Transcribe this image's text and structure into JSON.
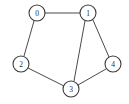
{
  "figure": {
    "background_color": "#ffffff",
    "width": 129,
    "height": 104
  },
  "style": {
    "edge_color": "#4a4a4a",
    "edge_width": 1,
    "node_fill": "#ffffff",
    "node_stroke": "#3a3a3a",
    "node_stroke_width": 1.1,
    "node_radius": 8,
    "label_color": "#2b2b2b",
    "label_font_size": 7.5
  },
  "graph": {
    "directed": false,
    "node_count": 5,
    "edge_count": 6,
    "nodes": [
      {
        "id": "0",
        "label": "0",
        "x": 37,
        "y": 13
      },
      {
        "id": "1",
        "label": "1",
        "x": 88,
        "y": 13
      },
      {
        "id": "2",
        "label": "2",
        "x": 21,
        "y": 64
      },
      {
        "id": "3",
        "label": "3",
        "x": 71,
        "y": 89
      },
      {
        "id": "4",
        "label": "4",
        "x": 113,
        "y": 64
      }
    ],
    "edges": [
      {
        "id": "e-0-1",
        "source": "0",
        "target": "1",
        "x1": 45,
        "y1": 13,
        "x2": 80,
        "y2": 13
      },
      {
        "id": "e-0-2",
        "source": "0",
        "target": "2",
        "x1": 34,
        "y1": 21,
        "x2": 24,
        "y2": 56
      },
      {
        "id": "e-2-3",
        "source": "2",
        "target": "3",
        "x1": 28,
        "y1": 68,
        "x2": 64,
        "y2": 86
      },
      {
        "id": "e-1-3",
        "source": "1",
        "target": "3",
        "x1": 85,
        "y1": 21,
        "x2": 74,
        "y2": 81
      },
      {
        "id": "e-1-4",
        "source": "1",
        "target": "4",
        "x1": 93,
        "y1": 20,
        "x2": 109,
        "y2": 57
      },
      {
        "id": "e-3-4",
        "source": "3",
        "target": "4",
        "x1": 78,
        "y1": 85,
        "x2": 106,
        "y2": 69
      }
    ]
  }
}
